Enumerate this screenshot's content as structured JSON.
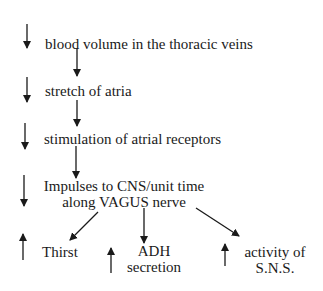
{
  "diagram": {
    "type": "flowchart",
    "steps": [
      {
        "direction": "decrease",
        "label": "blood volume in the thoracic veins"
      },
      {
        "direction": "decrease",
        "label": "stretch of atria"
      },
      {
        "direction": "decrease",
        "label": "stimulation of atrial receptors"
      },
      {
        "direction": "decrease",
        "label_line1": "Impulses to CNS/unit time",
        "label_line2": "along VAGUS nerve"
      }
    ],
    "outcomes": [
      {
        "direction": "increase",
        "label": "Thirst"
      },
      {
        "direction": "increase",
        "label_line1": "ADH",
        "label_line2": "secretion"
      },
      {
        "direction": "increase",
        "label_line1": "activity of",
        "label_line2": "S.N.S."
      }
    ],
    "colors": {
      "ink": "#1a1a1a",
      "background": "#ffffff"
    }
  }
}
